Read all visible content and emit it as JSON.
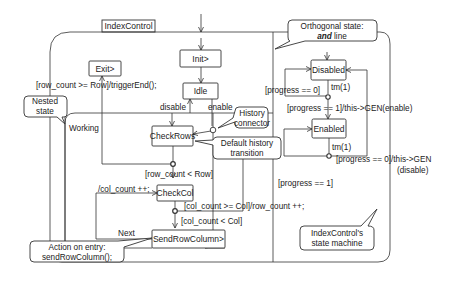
{
  "diagram": {
    "title_tab": "IndexControl",
    "states": {
      "init": "Init>",
      "idle": "Idle",
      "exit": "Exit>",
      "working": "Working",
      "check_rows": "CheckRows",
      "check_col": "CheckCol",
      "send_row_column": "SendRowColumn>",
      "disabled": "Disabled",
      "enabled": "Enabled"
    },
    "transitions": {
      "exit_guard": "[row_count >= Row]/triggerEnd();",
      "disable": "disable",
      "enable": "enable",
      "row_lt": "[row_count < Row]",
      "col_inc": "/col_count ++;",
      "col_ge": "[col_count >= Col]/row_count ++;",
      "col_lt": "[col_count < Col]",
      "next": "Next",
      "progress_0_top": "[progress == 0]",
      "tm1_top": "tm(1)",
      "progress_1_enable": "[progress == 1]/this->GEN(enable)",
      "tm1_bottom": "tm(1)",
      "progress_0_disable_1": "[progress == 0]/this->GEN",
      "progress_0_disable_2": "(disable)",
      "progress_1_bottom": "[progress == 1]"
    },
    "callouts": {
      "orthogonal_1": "Orthogonal state:",
      "orthogonal_2_em": "and",
      "orthogonal_2_rest": " line",
      "nested_1": "Nested",
      "nested_2": "state",
      "history_1": "History",
      "history_2": "connector",
      "default_history_1": "Default history",
      "default_history_2": "transition",
      "action_entry_1": "Action on entry:",
      "action_entry_2": "sendRowColumn();",
      "machine_1": "IndexControl's",
      "machine_2": "state machine"
    },
    "colors": {
      "line": "#333333",
      "text": "#222222",
      "background": "#ffffff"
    }
  }
}
